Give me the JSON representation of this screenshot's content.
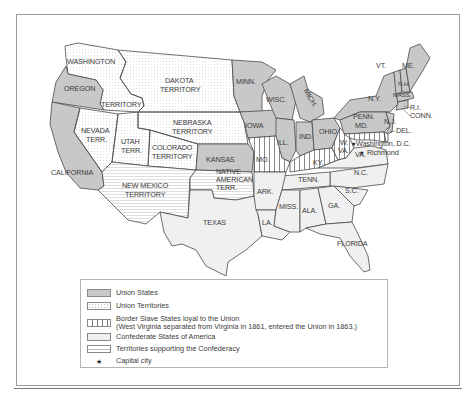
{
  "map": {
    "title": "The Union and the Confederacy, 1861-1863",
    "colors": {
      "union_states": "#c8c8c8",
      "union_territories": "#ffffff",
      "border_states": "#ffffff",
      "confederate": "#f0f0f0",
      "territories_confederacy": "#ffffff",
      "outline": "#4a4a4a"
    },
    "labels": {
      "washington": "WASHINGTON",
      "territory": "TERRITORY",
      "oregon": "OREGON",
      "dakota1": "DAKOTA",
      "dakota2": "TERRITORY",
      "nebraska1": "NEBRASKA",
      "nebraska2": "TERRITORY",
      "nevada1": "NEVADA",
      "nevada2": "TERR.",
      "utah1": "UTAH",
      "utah2": "TERR.",
      "colorado1": "COLORADO",
      "colorado2": "TERRITORY",
      "california": "CALIFORNIA",
      "new_mexico1": "NEW MEXICO",
      "new_mexico2": "TERRITORY",
      "kansas": "KANSAS",
      "native1": "NATIVE",
      "native2": "AMERICAN",
      "native3": "TERR.",
      "texas": "TEXAS",
      "minn": "MINN.",
      "iowa": "IOWA",
      "wisc": "WISC.",
      "mich": "MICH.",
      "ill": "ILL.",
      "ind": "IND.",
      "ohio": "OHIO",
      "mo": "MO.",
      "ky": "KY.",
      "ark": "ARK.",
      "tenn": "TENN.",
      "la": "LA.",
      "miss": "MISS.",
      "ala": "ALA.",
      "ga": "GA.",
      "sc": "S.C.",
      "nc": "N.C.",
      "florida": "FLORIDA",
      "va": "VA.",
      "wva1": "W.",
      "wva2": "VA.",
      "ny": "N.Y.",
      "penn": "PENN.",
      "md": "MD.",
      "nj": "N.J.",
      "del": "DEL.",
      "vt": "VT.",
      "me": "ME.",
      "nh": "N.H.",
      "mass": "MASS.",
      "ri": "R.I.",
      "conn": "CONN.",
      "washington_dc": "Washington, D.C.",
      "richmond": "Richmond"
    }
  },
  "legend": {
    "items": [
      {
        "key": "union-states",
        "label": "Union States"
      },
      {
        "key": "union-territories",
        "label": "Union Territories"
      },
      {
        "key": "border-states",
        "label": "Border Slave States loyal to the Union",
        "sublabel": "(West Virginia separated from Virginia in 1861, entered the Union in 1863.)"
      },
      {
        "key": "confederate-states",
        "label": "Confederate States of America"
      },
      {
        "key": "territories-confederacy",
        "label": "Territories supporting the Confederacy"
      },
      {
        "key": "capital-city",
        "label": "Capital city",
        "symbol": "★"
      }
    ]
  }
}
